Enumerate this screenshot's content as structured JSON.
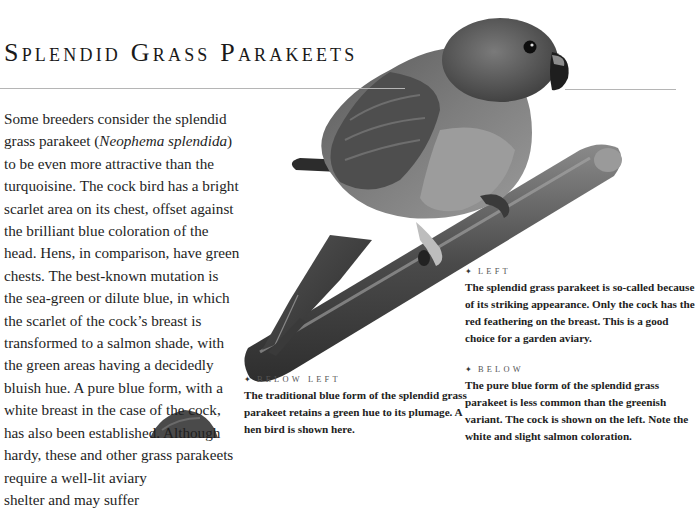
{
  "page": {
    "title": "Splendid Grass Parakeets",
    "body_lines": [
      "Some breeders consider the splendid",
      "grass parakeet (",
      "Neophema splendida",
      ")",
      "to be even more attractive than the",
      "turquoisine. The cock bird has a bright",
      "scarlet area on its chest, offset against",
      "the brilliant blue coloration of the",
      "head. Hens, in comparison, have green",
      "chests. The best-known mutation is",
      "the sea-green or dilute blue, in which",
      "the scarlet of the cock’s breast is",
      "transformed to a salmon shade, with",
      "the green areas having a decidedly",
      "bluish hue. A pure blue form, with a",
      "white breast in the case of the cock,",
      "has also been established. Although",
      "hardy, these and other grass parakeets",
      "require a well-lit aviary",
      "shelter and may suffer"
    ]
  },
  "captions": {
    "below_left": {
      "heading": "BELOW LEFT",
      "lines": [
        "The traditional blue form of the splendid grass",
        "parakeet retains a green hue to its plumage. A",
        "hen bird is shown here."
      ]
    },
    "left": {
      "heading": "LEFT",
      "lines": [
        "The splendid grass parakeet is so-called because",
        "of its striking appearance. Only the cock has the",
        "red feathering on the breast. This is a good",
        "choice for a garden aviary."
      ]
    },
    "below": {
      "heading": "BELOW",
      "lines": [
        "The pure blue form of the splendid grass",
        "parakeet is less common than the greenish",
        "variant. The cock is shown on the left. Note the",
        "white and slight salmon coloration."
      ]
    }
  },
  "icons": {
    "bullet": "✦"
  },
  "images": {
    "main_photo": "parakeet-on-perch",
    "partial_photo": "second-bird-partial"
  }
}
